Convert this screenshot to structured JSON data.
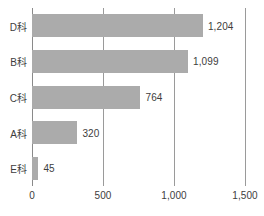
{
  "chart_data": {
    "type": "bar",
    "orientation": "horizontal",
    "title": "",
    "subtitle": "",
    "xlabel": "",
    "ylabel": "",
    "categories": [
      "D科",
      "B科",
      "C科",
      "A科",
      "E科"
    ],
    "values": [
      1204,
      1099,
      764,
      320,
      45
    ],
    "value_labels": [
      "1,204",
      "1,099",
      "764",
      "320",
      "45"
    ],
    "xlim": [
      0,
      1500
    ],
    "xticks": [
      0,
      500,
      1000,
      1500
    ],
    "xtick_labels": [
      "0",
      "500",
      "1,000",
      "1,500"
    ],
    "grid": "vertical",
    "legend": "none",
    "bars": [
      {
        "category": "D科",
        "value": 1204,
        "label": "1,204"
      },
      {
        "category": "B科",
        "value": 1099,
        "label": "1,099"
      },
      {
        "category": "C科",
        "value": 764,
        "label": "764"
      },
      {
        "category": "A科",
        "value": 320,
        "label": "320"
      },
      {
        "category": "E科",
        "value": 45,
        "label": "45"
      }
    ],
    "colors": {
      "bar_fill": "#ababab",
      "axis": "#8a8a8a",
      "gridline": "#9a9a9a",
      "text": "#3d3d3d",
      "background": "#ffffff"
    }
  }
}
